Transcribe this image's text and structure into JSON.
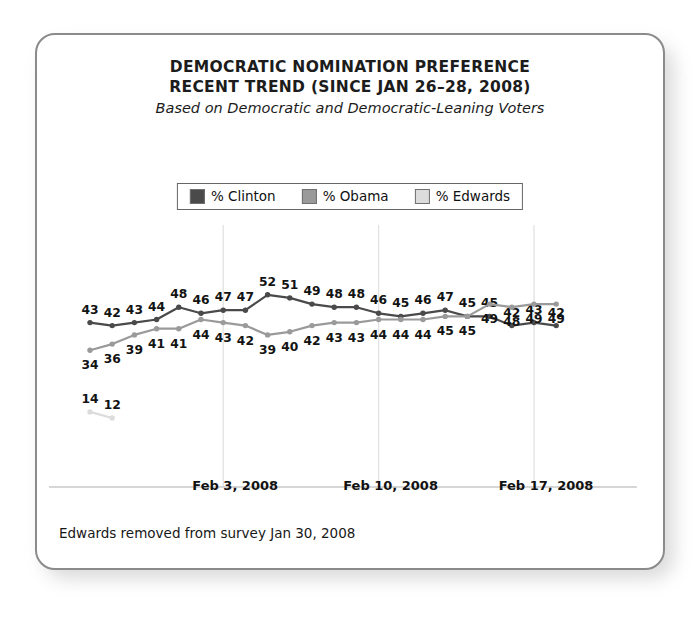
{
  "card": {
    "title_line_1": "DEMOCRATIC NOMINATION PREFERENCE",
    "title_line_2": "RECENT TREND (SINCE JAN 26–28, 2008)",
    "subtitle": "Based on Democratic and Democratic-Leaning Voters",
    "footnote": "Edwards removed from survey Jan 30, 2008"
  },
  "legend": {
    "items": [
      {
        "label": "% Clinton",
        "color": "#4a4a4a"
      },
      {
        "label": "% Obama",
        "color": "#9a9a9a"
      },
      {
        "label": "% Edwards",
        "color": "#dcdcdc"
      }
    ]
  },
  "chart_data": {
    "type": "line",
    "title": "DEMOCRATIC NOMINATION PREFERENCE RECENT TREND (SINCE JAN 26–28, 2008)",
    "subtitle": "Based on Democratic and Democratic-Leaning Voters",
    "xlabel": "",
    "ylabel": "",
    "ylim": [
      0,
      60
    ],
    "grid": "vertical-only",
    "legend_position": "top-center",
    "annotations": [
      "Edwards removed from survey Jan 30, 2008"
    ],
    "x_tick_labels": [
      "Feb 3, 2008",
      "Feb 10, 2008",
      "Feb 17, 2008"
    ],
    "x_tick_indices": [
      6,
      13,
      20
    ],
    "n_points": 22,
    "series": [
      {
        "name": "% Clinton",
        "color": "#4a4a4a",
        "values": [
          43,
          42,
          43,
          44,
          48,
          46,
          47,
          47,
          52,
          51,
          49,
          48,
          48,
          46,
          45,
          46,
          47,
          45,
          45,
          42,
          43,
          42
        ]
      },
      {
        "name": "% Obama",
        "color": "#9a9a9a",
        "values": [
          34,
          36,
          39,
          41,
          41,
          44,
          43,
          42,
          39,
          40,
          42,
          43,
          43,
          44,
          44,
          44,
          45,
          45,
          49,
          48,
          49,
          49
        ]
      },
      {
        "name": "% Edwards",
        "color": "#dcdcdc",
        "values": [
          14,
          12
        ]
      }
    ]
  }
}
